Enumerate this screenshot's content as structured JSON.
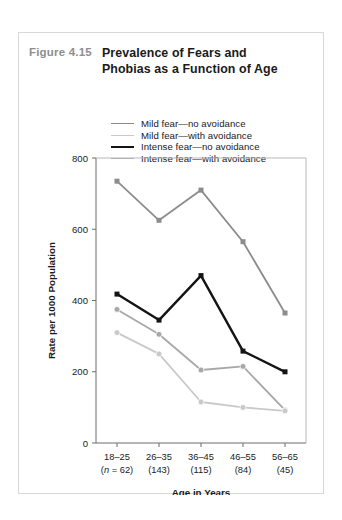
{
  "figure": {
    "number": "Figure 4.15",
    "title_line_1": "Prevalence of Fears and",
    "title_line_2": "Phobias as a Function of Age"
  },
  "legend": {
    "position": "top-center",
    "items": [
      {
        "label": "Mild fear—no avoidance",
        "color": "#8c8c8c",
        "width": 1.8
      },
      {
        "label": "Mild fear—with avoidance",
        "color": "#c9c9c9",
        "width": 1.8
      },
      {
        "label": "Intense fear—no avoidance",
        "color": "#141414",
        "width": 2.4
      },
      {
        "label": "Intense fear—with avoidance",
        "color": "#a8a8a8",
        "width": 1.8
      }
    ]
  },
  "chart_data": {
    "type": "line",
    "title": "Prevalence of Fears and Phobias as a Function of Age",
    "xlabel": "Age in Years",
    "ylabel": "Rate per 1000 Population",
    "categories": [
      "18–25",
      "26–35",
      "36–45",
      "46–55",
      "56–65"
    ],
    "category_sublabels": [
      "(n = 62)",
      "(143)",
      "(115)",
      "(84)",
      "(45)"
    ],
    "sample_sizes": [
      62,
      143,
      115,
      84,
      45
    ],
    "ylim": [
      0,
      800
    ],
    "yticks": [
      0,
      200,
      400,
      600,
      800
    ],
    "ytick_labels": [
      "0",
      "200",
      "400",
      "600",
      "800"
    ],
    "grid": false,
    "legend_position": "above-plot",
    "series": [
      {
        "name": "Mild fear—no avoidance",
        "color": "#8c8c8c",
        "width": 1.8,
        "marker": "square",
        "values": [
          735,
          625,
          710,
          565,
          365
        ]
      },
      {
        "name": "Mild fear—with avoidance",
        "color": "#c9c9c9",
        "width": 1.8,
        "marker": "circle",
        "values": [
          310,
          250,
          115,
          100,
          90
        ]
      },
      {
        "name": "Intense fear—no avoidance",
        "color": "#141414",
        "width": 2.4,
        "marker": "square",
        "values": [
          418,
          345,
          470,
          258,
          200
        ]
      },
      {
        "name": "Intense fear—with avoidance",
        "color": "#a8a8a8",
        "width": 1.8,
        "marker": "circle",
        "values": [
          375,
          305,
          205,
          215,
          92
        ]
      }
    ]
  }
}
